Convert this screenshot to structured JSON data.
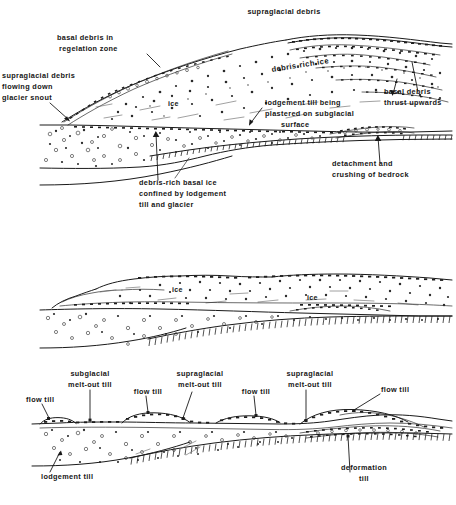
{
  "figure": {
    "ink_color": "#161616",
    "background_color": "#ffffff",
    "panel_count": 3
  },
  "panel_top": {
    "name": "active glacier snout",
    "labels": {
      "supraglacial_debris_top": "supraglacial debris",
      "basal_debris_regelation": "basal debris in\nregelation zone",
      "basal_debris_regelation_l1": "basal debris in",
      "basal_debris_regelation_l2": "regelation zone",
      "supraglacial_flowing_l1": "supraglacial debris",
      "supraglacial_flowing_l2": "flowing down",
      "supraglacial_flowing_l3": "glacier snout",
      "debris_rich_ice": "debris-rich ice",
      "ice": "ice",
      "lodgement_till_l1": "lodgement till being",
      "lodgement_till_l2": "plastered on subglacial",
      "lodgement_till_l3": "surface",
      "basal_debris_thrust_l1": "basal debris",
      "basal_debris_thrust_l2": "thrust upwards",
      "debris_rich_basal_l1": "debris-rich basal ice",
      "debris_rich_basal_l2": "confined by lodgement",
      "debris_rich_basal_l3": "till and glacier",
      "detachment_l1": "detachment and",
      "detachment_l2": "crushing of bedrock"
    }
  },
  "panel_middle": {
    "name": "stagnant ice with debris bands",
    "labels": {
      "ice_left": "ice",
      "ice_right": "ice"
    }
  },
  "panel_bottom": {
    "name": "final till sequence after melt-out",
    "labels": {
      "flow_till_1": "flow till",
      "subglacial_meltout_l1": "subglacial",
      "subglacial_meltout_l2": "melt-out till",
      "flow_till_2": "flow till",
      "supraglacial_meltout_a_l1": "supraglacial",
      "supraglacial_meltout_a_l2": "melt-out till",
      "flow_till_3": "flow till",
      "supraglacial_meltout_b_l1": "supraglacial",
      "supraglacial_meltout_b_l2": "melt-out till",
      "flow_till_4": "flow till",
      "lodgement_till": "lodgement till",
      "deformation_till_l1": "deformation",
      "deformation_till_l2": "till"
    }
  }
}
